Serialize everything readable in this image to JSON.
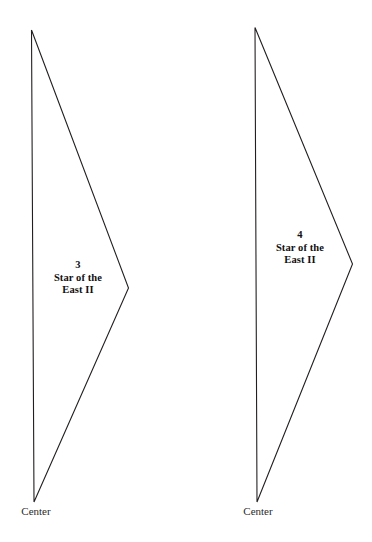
{
  "figure": {
    "background_color": "#ffffff",
    "stroke_color": "#231f20"
  },
  "wedges": [
    {
      "lot_number": "3",
      "name_line_1": "Star of the",
      "name_line_2": "East II",
      "center_label": "Center"
    },
    {
      "lot_number": "4",
      "name_line_1": "Star of the",
      "name_line_2": "East II",
      "center_label": "Center"
    }
  ]
}
